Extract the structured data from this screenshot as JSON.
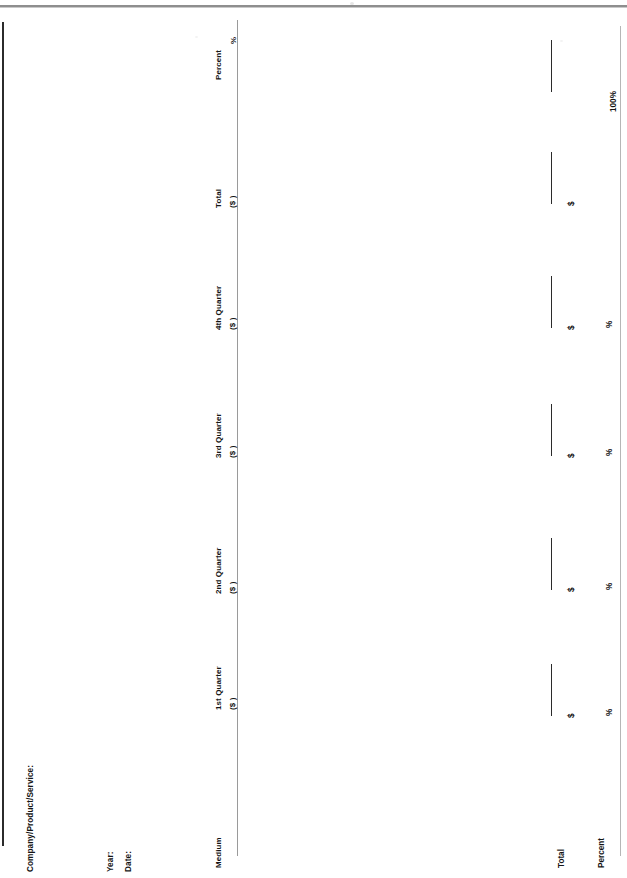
{
  "document": {
    "type": "media-budget-planning-form",
    "orientation": "rotated-90-ccw",
    "fields": {
      "company": "Company/Product/Service:",
      "year": "Year:",
      "date": "Date:"
    },
    "table": {
      "row_header_label": "Medium",
      "columns": [
        {
          "id": "q1",
          "title": "1st Quarter",
          "unit": "($          )"
        },
        {
          "id": "q2",
          "title": "2nd Quarter",
          "unit": "($          )"
        },
        {
          "id": "q3",
          "title": "3rd Quarter",
          "unit": "($          )"
        },
        {
          "id": "q4",
          "title": "4th Quarter",
          "unit": "($          )"
        },
        {
          "id": "total",
          "title": "Total",
          "unit": "($          )"
        },
        {
          "id": "percent",
          "title": "Percent",
          "unit": "%"
        }
      ],
      "summary_rows": [
        {
          "id": "total-row",
          "label": "Total",
          "cells": [
            {
              "col": "q1",
              "marker": "$"
            },
            {
              "col": "q2",
              "marker": "$"
            },
            {
              "col": "q3",
              "marker": "$"
            },
            {
              "col": "q4",
              "marker": "$"
            },
            {
              "col": "total",
              "marker": "$"
            },
            {
              "col": "percent",
              "marker": ""
            }
          ]
        },
        {
          "id": "percent-row",
          "label": "Percent",
          "cells": [
            {
              "col": "q1",
              "marker": "%"
            },
            {
              "col": "q2",
              "marker": "%"
            },
            {
              "col": "q3",
              "marker": "%"
            },
            {
              "col": "q4",
              "marker": "%"
            },
            {
              "col": "total",
              "marker": "100%"
            },
            {
              "col": "percent",
              "marker": ""
            }
          ]
        }
      ],
      "entry_rows_blank": true
    },
    "colors": {
      "ink": "#151515",
      "rule": "#2b2b2b",
      "rule_light": "#9a9a9a",
      "paper": "#ffffff"
    }
  }
}
